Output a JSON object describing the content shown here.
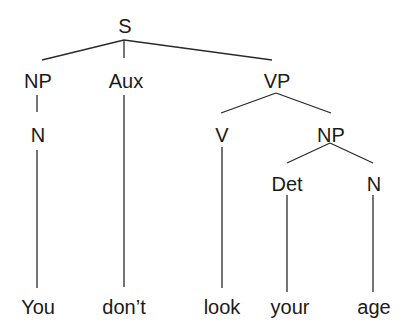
{
  "tree": {
    "root": "S",
    "nodes": {
      "s": "S",
      "np1": "NP",
      "aux": "Aux",
      "vp": "VP",
      "n1": "N",
      "v": "V",
      "np2": "NP",
      "det": "Det",
      "n2": "N"
    },
    "words": {
      "w1": "You",
      "w2": "don’t",
      "w3": "look",
      "w4": "your",
      "w5": "age"
    },
    "bracketing": "[S [NP [N You]] [Aux don’t] [VP [V look] [NP [Det your] [N age]]]]"
  }
}
